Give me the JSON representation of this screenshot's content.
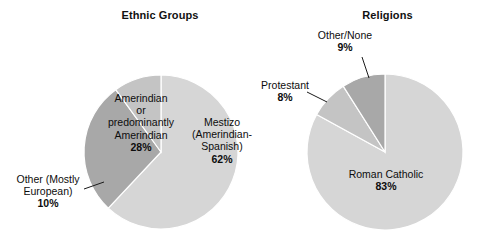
{
  "page": {
    "background": "#ffffff",
    "width": 481,
    "height": 248
  },
  "charts": [
    {
      "id": "ethnic-groups",
      "title": "Ethnic Groups"
    },
    {
      "id": "religions",
      "title": "Religions"
    }
  ],
  "labels": {
    "mestizo": {
      "line1": "Mestizo",
      "line2": "(Amerindian-",
      "line3": "Spanish)",
      "pct": "62%"
    },
    "amerindian": {
      "line1": "Amerindian",
      "line2": "or",
      "line3": "predominantly",
      "line4": "Amerindian",
      "pct": "28%"
    },
    "other_european": {
      "line1": "Other (Mostly",
      "line2": "European)",
      "pct": "10%"
    },
    "roman_catholic": {
      "line1": "Roman Catholic",
      "pct": "83%"
    },
    "protestant": {
      "line1": "Protestant",
      "pct": "8%"
    },
    "other_none": {
      "line1": "Other/None",
      "pct": "9%"
    }
  },
  "chart_data": [
    {
      "type": "pie",
      "title": "Ethnic Groups",
      "categories": [
        "Mestizo (Amerindian-Spanish)",
        "Amerindian or predominantly Amerindian",
        "Other (Mostly European)"
      ],
      "values": [
        62,
        28,
        10
      ],
      "units": "percent",
      "colors": [
        "#d6d6d6",
        "#a8a8a8",
        "#c4c4c4"
      ],
      "legend": "none",
      "labels_inline": true,
      "start_angle_deg": 0,
      "direction": "clockwise",
      "geometry": {
        "center_x": 161,
        "center_y": 152,
        "radius": 77
      }
    },
    {
      "type": "pie",
      "title": "Religions",
      "categories": [
        "Roman Catholic",
        "Protestant",
        "Other/None"
      ],
      "values": [
        83,
        8,
        9
      ],
      "units": "percent",
      "colors": [
        "#d6d6d6",
        "#c4c4c4",
        "#a8a8a8"
      ],
      "legend": "none",
      "labels_inline": true,
      "start_angle_deg": 0,
      "direction": "clockwise",
      "geometry": {
        "center_x": 385,
        "center_y": 152,
        "radius": 78
      }
    }
  ]
}
